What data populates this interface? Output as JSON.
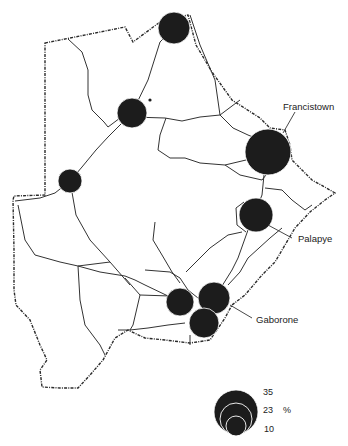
{
  "map": {
    "country": "Botswana",
    "symbol": "proportional circles",
    "colors": {
      "circle": "#1c1c1c",
      "roads": "#333333",
      "border": "#2a2a2a",
      "background": "#ffffff"
    }
  },
  "towns": [
    {
      "id": "north",
      "label": "",
      "cx": 174,
      "cy": 28,
      "r": 16
    },
    {
      "id": "maun",
      "label": "",
      "cx": 132,
      "cy": 113,
      "r": 15
    },
    {
      "id": "francistown",
      "label": "Francistown",
      "cx": 268,
      "cy": 152,
      "r": 23
    },
    {
      "id": "west",
      "label": "",
      "cx": 70,
      "cy": 181,
      "r": 12
    },
    {
      "id": "palapye",
      "label": "Palapye",
      "cx": 256,
      "cy": 215,
      "r": 17
    },
    {
      "id": "molepolole",
      "label": "",
      "cx": 180,
      "cy": 302,
      "r": 14
    },
    {
      "id": "mochudi",
      "label": "",
      "cx": 214,
      "cy": 298,
      "r": 16
    },
    {
      "id": "gaborone",
      "label": "Gaborone",
      "cx": 204,
      "cy": 323,
      "r": 15
    }
  ],
  "labels": {
    "francistown": "Francistown",
    "palapye": "Palapye",
    "gaborone": "Gaborone"
  },
  "legend": {
    "unit": "%",
    "values": [
      "35",
      "23",
      "10"
    ]
  }
}
